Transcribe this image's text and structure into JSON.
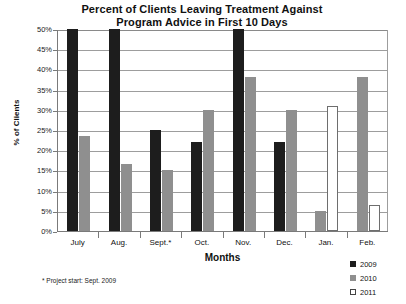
{
  "chart_data": {
    "type": "bar",
    "title": "Percent of Clients Leaving Treatment Against Program Advice in First 10 Days",
    "title_line1": "Percent of Clients Leaving Treatment Against",
    "title_line2": "Program Advice in First 10 Days",
    "xlabel": "Months",
    "ylabel": "% of Clients",
    "ylim": [
      0,
      50
    ],
    "ytick_labels": [
      "50%",
      "45%",
      "40%",
      "35%",
      "30%",
      "25%",
      "20%",
      "15%",
      "10%",
      "5%",
      "0%"
    ],
    "ytick_values": [
      50,
      45,
      40,
      35,
      30,
      25,
      20,
      15,
      10,
      5,
      0
    ],
    "grid": true,
    "legend_position": "bottom-right",
    "categories": [
      "July",
      "Aug.",
      "Sept.*",
      "Oct.",
      "Nov.",
      "Dec.",
      "Jan.",
      "Feb."
    ],
    "series": [
      {
        "name": "2009",
        "color": "#1d1d1d",
        "values": [
          50,
          50,
          25,
          22,
          50,
          22,
          null,
          null
        ]
      },
      {
        "name": "2010",
        "color": "#8f8f8f",
        "values": [
          23.5,
          16.5,
          15,
          30,
          38,
          30,
          5,
          38
        ]
      },
      {
        "name": "2011",
        "color": "#ffffff",
        "values": [
          null,
          null,
          null,
          null,
          null,
          null,
          31,
          6.5
        ]
      }
    ],
    "annotations": [
      "* Project start: Sept. 2009"
    ]
  },
  "footnote": "* Project start: Sept. 2009",
  "legend": {
    "items": [
      {
        "label": "2009",
        "swatch": "black-square-icon"
      },
      {
        "label": "2010",
        "swatch": "gray-square-icon"
      },
      {
        "label": "2011",
        "swatch": "white-square-icon"
      }
    ]
  }
}
